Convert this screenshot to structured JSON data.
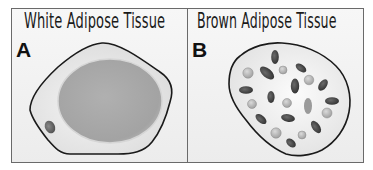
{
  "figure": {
    "panels": [
      {
        "letter": "A",
        "title": "White Adipose Tissue",
        "cell": {
          "type": "white adipocyte",
          "lipid_droplets": 1,
          "nuclei": 1
        }
      },
      {
        "letter": "B",
        "title": "Brown Adipose Tissue",
        "cell": {
          "type": "brown adipocyte",
          "lipid_droplets_light": 8,
          "mitochondria_dark": 13
        }
      }
    ],
    "colors": {
      "background": "#ffffff",
      "panel_fill": "#f2f2f2",
      "border": "#555555",
      "cell_outline": "#1a1a1a",
      "droplet": "#a9a9a9",
      "dark_organelle": "#3a3a3a",
      "light_organelle": "#b8b8b8"
    }
  }
}
